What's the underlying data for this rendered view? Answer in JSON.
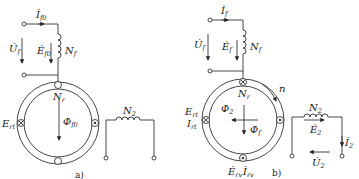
{
  "figure": {
    "panel_a": {
      "caption": "a)",
      "current": {
        "sym": "I",
        "sub": "f0"
      },
      "voltage": {
        "sym": "U",
        "sub": "f"
      },
      "emf": {
        "sym": "E",
        "sub": "f0"
      },
      "field_winding": {
        "sym": "N",
        "sub": "f"
      },
      "rotor_winding": {
        "sym": "N",
        "sub": "r"
      },
      "flux": {
        "sym": "Φ",
        "sub": "f0"
      },
      "rotor_emf": {
        "sym": "E",
        "sub": "rt"
      },
      "secondary_winding": {
        "sym": "N",
        "sub": "2"
      }
    },
    "panel_b": {
      "caption": "b)",
      "current": {
        "sym": "I",
        "sub": "f"
      },
      "voltage": {
        "sym": "U",
        "sub": "f"
      },
      "emf": {
        "sym": "E",
        "sub": "f"
      },
      "field_winding": {
        "sym": "N",
        "sub": "f"
      },
      "rotor_winding": {
        "sym": "N",
        "sub": "r"
      },
      "speed": "n",
      "flux2": {
        "sym": "Φ",
        "sub": "2"
      },
      "flux_f": {
        "sym": "Φ",
        "sub": "f"
      },
      "rotor_emf": {
        "sym": "E",
        "sub": "rt"
      },
      "rotor_current": {
        "sym": "I",
        "sub": "rt"
      },
      "rotor_emf_v": {
        "sym": "E",
        "sub": "rv"
      },
      "rotor_current_v": {
        "sym": "I",
        "sub": "rv"
      },
      "secondary_winding": {
        "sym": "N",
        "sub": "2"
      },
      "secondary_emf": {
        "sym": "E",
        "sub": "2"
      },
      "secondary_current": {
        "sym": "I",
        "sub": "2"
      },
      "secondary_voltage": {
        "sym": "U",
        "sub": "2"
      }
    }
  }
}
